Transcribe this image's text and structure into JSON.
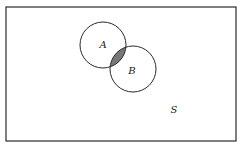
{
  "diagram": {
    "type": "venn",
    "universe": {
      "label": "S",
      "x": 6,
      "y": 7,
      "width": 230,
      "height": 134,
      "label_pos": [
        174,
        113
      ]
    },
    "sets": [
      {
        "label": "A",
        "cx": 103,
        "cy": 45,
        "r": 23,
        "label_pos": [
          103,
          48
        ]
      },
      {
        "label": "B",
        "cx": 133,
        "cy": 69,
        "r": 23,
        "label_pos": [
          132,
          74
        ]
      }
    ],
    "shaded_region": "A ∩ B",
    "colors": {
      "stroke": "#2a2a2a",
      "shade": "#777777",
      "background": "#ffffff"
    }
  }
}
